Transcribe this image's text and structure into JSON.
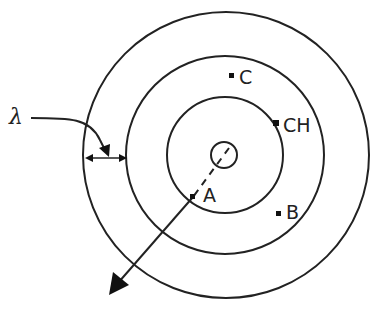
{
  "diagram": {
    "type": "concentric-circles",
    "stroke_color": "#222222",
    "background": "#ffffff",
    "center": {
      "x": 226,
      "y": 155
    },
    "rings": [
      {
        "name": "source",
        "r": 13
      },
      {
        "name": "inner",
        "r": 58
      },
      {
        "name": "middle",
        "r": 99
      },
      {
        "name": "outer",
        "r": 143
      }
    ],
    "labels": {
      "lambda": "λ",
      "point_a": "A",
      "point_b": "B",
      "point_c": "C",
      "point_ch": "CH"
    },
    "points": [
      {
        "label": "A",
        "x": 193,
        "y": 197
      },
      {
        "label": "B",
        "x": 279,
        "y": 214
      },
      {
        "label": "C",
        "x": 232,
        "y": 76
      },
      {
        "label": "CH",
        "x": 276,
        "y": 123
      }
    ],
    "annotations": {
      "wavelength_marker": "spacing between outer and middle rings",
      "direction_arrow": "radial propagation arrow from center through A"
    }
  }
}
